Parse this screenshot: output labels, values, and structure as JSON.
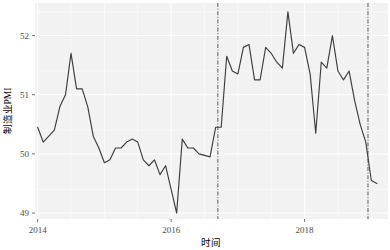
{
  "chart_data": {
    "type": "line",
    "title": "",
    "xlabel": "时间",
    "ylabel": "制造业PMI",
    "xlim": [
      2013.96,
      2019.25
    ],
    "ylim": [
      48.9,
      52.55
    ],
    "grid": true,
    "legend": "none",
    "line_color": "#3d3d3d",
    "panel_color": "#f2f2f2",
    "grid_color": "#ffffff",
    "x_ticks": [
      2014,
      2016,
      2018
    ],
    "x_tick_labels": [
      "2014",
      "2016",
      "2018"
    ],
    "y_ticks": [
      49,
      50,
      51,
      52
    ],
    "y_tick_labels": [
      "49",
      "50",
      "51",
      "52"
    ],
    "annotations": [
      {
        "name": "vline-1",
        "type": "vline",
        "x": 2016.7,
        "style": "dash-dot",
        "color": "#4a4a4a"
      },
      {
        "name": "vline-2",
        "type": "vline",
        "x": 2018.95,
        "style": "dash-dot",
        "color": "#4a4a4a"
      }
    ],
    "x": [
      2014.0,
      2014.083,
      2014.167,
      2014.25,
      2014.333,
      2014.417,
      2014.5,
      2014.583,
      2014.667,
      2014.75,
      2014.833,
      2014.917,
      2015.0,
      2015.083,
      2015.167,
      2015.25,
      2015.333,
      2015.417,
      2015.5,
      2015.583,
      2015.667,
      2015.75,
      2015.833,
      2015.917,
      2016.0,
      2016.083,
      2016.167,
      2016.25,
      2016.333,
      2016.417,
      2016.583,
      2016.667,
      2016.75,
      2016.833,
      2016.917,
      2017.0,
      2017.083,
      2017.167,
      2017.25,
      2017.333,
      2017.417,
      2017.5,
      2017.583,
      2017.667,
      2017.75,
      2017.833,
      2017.917,
      2018.0,
      2018.083,
      2018.167,
      2018.25,
      2018.333,
      2018.417,
      2018.5,
      2018.583,
      2018.667,
      2018.75,
      2018.833,
      2018.917,
      2019.0,
      2019.083
    ],
    "values": [
      50.45,
      50.2,
      50.3,
      50.4,
      50.8,
      51.0,
      51.7,
      51.1,
      51.1,
      50.8,
      50.3,
      50.1,
      49.85,
      49.9,
      50.1,
      50.1,
      50.2,
      50.25,
      50.2,
      49.9,
      49.8,
      49.9,
      49.65,
      49.8,
      49.4,
      49.0,
      50.25,
      50.1,
      50.1,
      50.0,
      49.95,
      50.45,
      50.45,
      51.65,
      51.4,
      51.35,
      51.8,
      51.85,
      51.25,
      51.25,
      51.8,
      51.7,
      51.55,
      51.45,
      52.4,
      51.7,
      51.85,
      51.8,
      51.35,
      50.35,
      51.55,
      51.45,
      52.0,
      51.4,
      51.25,
      51.4,
      50.9,
      50.5,
      50.2,
      49.55,
      49.5
    ]
  },
  "axis": {
    "y_label": "制造业PMI",
    "x_label": "时间",
    "y_tick_0": "49",
    "y_tick_1": "50",
    "y_tick_2": "51",
    "y_tick_3": "52",
    "x_tick_0": "2014",
    "x_tick_1": "2016",
    "x_tick_2": "2018"
  }
}
